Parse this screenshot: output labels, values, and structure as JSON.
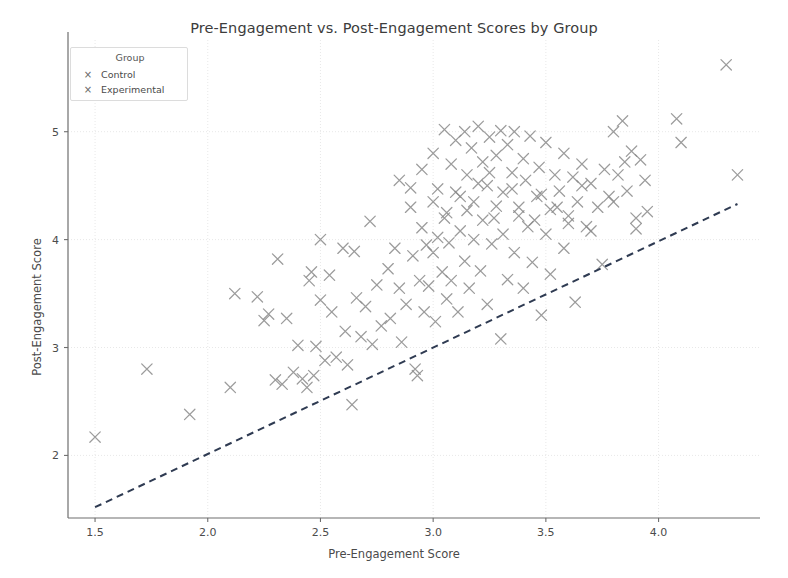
{
  "chart_data": {
    "type": "scatter",
    "title": "Pre-Engagement vs. Post-Engagement Scores by Group",
    "xlabel": "Pre-Engagement Score",
    "ylabel": "Post-Engagement Score",
    "xlim": [
      1.38,
      4.45
    ],
    "ylim": [
      1.42,
      5.85
    ],
    "xticks": [
      "1.5",
      "2.0",
      "2.5",
      "3.0",
      "3.5",
      "4.0"
    ],
    "xtick_values": [
      1.5,
      2.0,
      2.5,
      3.0,
      3.5,
      4.0
    ],
    "yticks": [
      "2",
      "3",
      "4",
      "5"
    ],
    "ytick_values": [
      2,
      3,
      4,
      5
    ],
    "grid": true,
    "grid_style": "dotted",
    "grid_color": "#e8e8e8",
    "marker": "x",
    "marker_color": "#8a8a8a",
    "legend": {
      "title": "Group",
      "position": "upper left",
      "entries": [
        {
          "label": "Control",
          "marker": "x",
          "color": "#777777"
        },
        {
          "label": "Experimental",
          "marker": "x",
          "color": "#8d8d8d"
        }
      ]
    },
    "reference_line": {
      "style": "dashed",
      "color": "#2f3b52",
      "x": [
        1.5,
        4.35
      ],
      "y": [
        1.52,
        4.33
      ]
    },
    "series": [
      {
        "name": "Control",
        "marker": "x",
        "color": "#8a8a8a",
        "points": [
          [
            1.5,
            2.17
          ],
          [
            1.73,
            2.8
          ],
          [
            1.92,
            2.38
          ],
          [
            2.1,
            2.63
          ],
          [
            2.12,
            3.5
          ],
          [
            2.22,
            3.47
          ],
          [
            2.25,
            3.25
          ],
          [
            2.27,
            3.31
          ],
          [
            2.3,
            2.7
          ],
          [
            2.31,
            3.82
          ],
          [
            2.33,
            2.66
          ],
          [
            2.35,
            3.27
          ],
          [
            2.38,
            2.77
          ],
          [
            2.4,
            3.02
          ],
          [
            2.42,
            2.71
          ],
          [
            2.44,
            2.63
          ],
          [
            2.45,
            3.62
          ],
          [
            2.46,
            3.7
          ],
          [
            2.47,
            2.74
          ],
          [
            2.48,
            3.01
          ],
          [
            2.5,
            4.0
          ],
          [
            2.5,
            3.44
          ],
          [
            2.52,
            2.88
          ],
          [
            2.54,
            3.67
          ],
          [
            2.55,
            3.33
          ],
          [
            2.57,
            2.91
          ],
          [
            2.6,
            3.92
          ],
          [
            2.61,
            3.15
          ],
          [
            2.62,
            2.84
          ],
          [
            2.64,
            2.47
          ],
          [
            2.65,
            3.89
          ],
          [
            2.66,
            3.46
          ],
          [
            2.68,
            3.1
          ],
          [
            2.7,
            3.38
          ],
          [
            2.72,
            4.17
          ],
          [
            2.73,
            3.03
          ],
          [
            2.75,
            3.58
          ],
          [
            2.77,
            3.2
          ],
          [
            2.8,
            3.73
          ],
          [
            2.81,
            3.27
          ],
          [
            2.83,
            3.92
          ],
          [
            2.85,
            3.55
          ],
          [
            2.86,
            3.05
          ],
          [
            2.88,
            3.4
          ],
          [
            2.9,
            4.48
          ],
          [
            2.91,
            3.85
          ],
          [
            2.92,
            2.8
          ],
          [
            2.93,
            2.74
          ],
          [
            2.94,
            3.62
          ],
          [
            2.95,
            4.11
          ],
          [
            2.96,
            3.33
          ],
          [
            2.97,
            3.95
          ],
          [
            2.98,
            3.57
          ],
          [
            3.0,
            4.35
          ],
          [
            3.0,
            3.88
          ],
          [
            3.01,
            3.24
          ],
          [
            3.02,
            4.02
          ],
          [
            3.04,
            3.7
          ],
          [
            3.05,
            4.2
          ],
          [
            3.06,
            3.45
          ],
          [
            3.07,
            3.97
          ],
          [
            3.08,
            3.62
          ],
          [
            3.1,
            4.44
          ],
          [
            3.11,
            3.33
          ],
          [
            3.12,
            4.08
          ],
          [
            3.14,
            3.8
          ],
          [
            3.15,
            4.27
          ],
          [
            3.16,
            3.55
          ],
          [
            3.18,
            4.0
          ],
          [
            3.2,
            4.52
          ],
          [
            3.21,
            3.71
          ],
          [
            3.22,
            4.18
          ],
          [
            3.24,
            3.4
          ],
          [
            3.25,
            4.62
          ],
          [
            3.26,
            3.96
          ],
          [
            3.28,
            4.31
          ],
          [
            3.3,
            3.08
          ],
          [
            3.31,
            4.05
          ],
          [
            3.33,
            3.63
          ],
          [
            3.35,
            4.47
          ],
          [
            3.36,
            3.88
          ],
          [
            3.38,
            4.22
          ],
          [
            3.4,
            3.55
          ],
          [
            3.42,
            4.12
          ],
          [
            3.44,
            3.79
          ],
          [
            3.46,
            4.4
          ],
          [
            3.48,
            3.3
          ],
          [
            3.5,
            4.05
          ],
          [
            3.52,
            3.68
          ],
          [
            3.55,
            4.3
          ],
          [
            3.58,
            3.92
          ],
          [
            3.6,
            4.15
          ],
          [
            3.63,
            3.42
          ],
          [
            3.66,
            4.5
          ],
          [
            3.7,
            4.08
          ],
          [
            3.75,
            3.77
          ],
          [
            3.8,
            4.35
          ],
          [
            3.85,
            4.72
          ],
          [
            3.9,
            4.1
          ],
          [
            3.95,
            4.26
          ]
        ]
      },
      {
        "name": "Experimental",
        "marker": "x",
        "color": "#8a8a8a",
        "points": [
          [
            2.85,
            4.55
          ],
          [
            2.9,
            4.3
          ],
          [
            2.95,
            4.65
          ],
          [
            3.0,
            4.8
          ],
          [
            3.02,
            4.47
          ],
          [
            3.05,
            5.02
          ],
          [
            3.06,
            4.25
          ],
          [
            3.08,
            4.7
          ],
          [
            3.1,
            4.92
          ],
          [
            3.12,
            4.4
          ],
          [
            3.14,
            5.0
          ],
          [
            3.15,
            4.6
          ],
          [
            3.17,
            4.85
          ],
          [
            3.18,
            4.35
          ],
          [
            3.2,
            5.05
          ],
          [
            3.22,
            4.72
          ],
          [
            3.24,
            4.5
          ],
          [
            3.25,
            4.95
          ],
          [
            3.27,
            4.2
          ],
          [
            3.28,
            4.78
          ],
          [
            3.3,
            5.01
          ],
          [
            3.31,
            4.44
          ],
          [
            3.33,
            4.88
          ],
          [
            3.35,
            4.62
          ],
          [
            3.36,
            5.0
          ],
          [
            3.38,
            4.3
          ],
          [
            3.4,
            4.75
          ],
          [
            3.41,
            4.55
          ],
          [
            3.43,
            4.96
          ],
          [
            3.45,
            4.18
          ],
          [
            3.47,
            4.67
          ],
          [
            3.48,
            4.42
          ],
          [
            3.5,
            4.9
          ],
          [
            3.52,
            4.28
          ],
          [
            3.54,
            4.6
          ],
          [
            3.56,
            4.45
          ],
          [
            3.58,
            4.8
          ],
          [
            3.6,
            4.22
          ],
          [
            3.62,
            4.58
          ],
          [
            3.64,
            4.35
          ],
          [
            3.66,
            4.7
          ],
          [
            3.68,
            4.12
          ],
          [
            3.7,
            4.52
          ],
          [
            3.73,
            4.3
          ],
          [
            3.76,
            4.65
          ],
          [
            3.78,
            4.4
          ],
          [
            3.8,
            5.0
          ],
          [
            3.82,
            4.6
          ],
          [
            3.84,
            5.1
          ],
          [
            3.86,
            4.45
          ],
          [
            3.88,
            4.82
          ],
          [
            3.9,
            4.2
          ],
          [
            3.92,
            4.74
          ],
          [
            3.94,
            4.55
          ],
          [
            4.08,
            5.12
          ],
          [
            4.1,
            4.9
          ],
          [
            4.3,
            5.62
          ],
          [
            4.35,
            4.6
          ]
        ]
      }
    ]
  }
}
